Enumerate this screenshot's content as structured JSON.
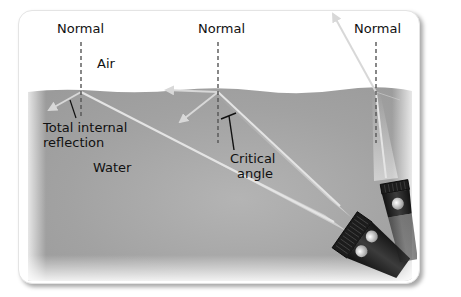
{
  "figure": {
    "labels": {
      "normal_left": "Normal",
      "normal_middle": "Normal",
      "normal_right": "Normal",
      "air": "Air",
      "water": "Water",
      "total_internal_reflection_line1": "Total internal",
      "total_internal_reflection_line2": "reflection",
      "critical_angle_line1": "Critical",
      "critical_angle_line2": "angle"
    },
    "colors": {
      "air": "#ffffff",
      "water": "#a9a9a9",
      "ray": "#e2e2e2",
      "normal_line": "#555555",
      "flashlight_body": "#2a2a2a",
      "text": "#111111"
    }
  }
}
